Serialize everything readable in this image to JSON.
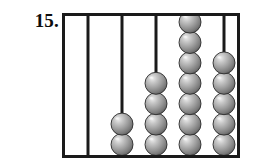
{
  "problem": {
    "number_label": "15."
  },
  "figure": {
    "type": "abacus",
    "alt_text": "Abacus with five vertical rods holding gray beads",
    "frame": {
      "x": 0,
      "y": 0,
      "width": 178,
      "height": 145,
      "border_color": "#1a1a1a",
      "border_width": 3,
      "fill_color": "#ffffff"
    },
    "bead": {
      "diameter": 22,
      "fill_color": "#9a9a9a",
      "shade_color": "#5d5d5d",
      "highlight_color": "#e8e8e8",
      "outline_color": "#2b2b2b"
    },
    "rod": {
      "width": 3,
      "color": "#1a1a1a",
      "top_y": 2,
      "bottom_y": 143
    },
    "rods": [
      {
        "name": "rod-1",
        "x": 26,
        "bead_count": 0
      },
      {
        "name": "rod-2",
        "x": 60,
        "bead_count": 2
      },
      {
        "name": "rod-3",
        "x": 94,
        "bead_count": 4
      },
      {
        "name": "rod-4",
        "x": 128,
        "bead_count": 7
      },
      {
        "name": "rod-5",
        "x": 162,
        "bead_count": 5
      }
    ],
    "bead_counts": [
      0,
      2,
      4,
      7,
      5
    ],
    "total_beads": 18
  }
}
